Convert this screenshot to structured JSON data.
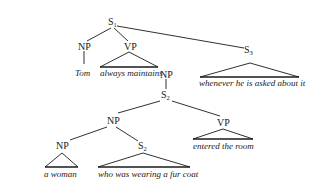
{
  "diagram": {
    "type": "syntax-tree",
    "nodes": {
      "s1": {
        "label": "S",
        "sub": "1"
      },
      "np_tom": {
        "label": "NP"
      },
      "vp_main": {
        "label": "VP"
      },
      "s3": {
        "label": "S",
        "sub": "3"
      },
      "np_obj": {
        "label": "NP"
      },
      "s2_clause": {
        "label": "S",
        "sub": "2"
      },
      "np_subj": {
        "label": "NP"
      },
      "vp_entered": {
        "label": "VP"
      },
      "np_woman": {
        "label": "NP"
      },
      "s2_rel": {
        "label": "S",
        "sub": "2"
      }
    },
    "leaves": {
      "tom": "Tom",
      "always_maintains": "always maintains",
      "whenever": "whenever he is asked about it",
      "entered": "entered the room",
      "a_woman": "a woman",
      "who_was": "who was wearing a fur coat"
    }
  }
}
